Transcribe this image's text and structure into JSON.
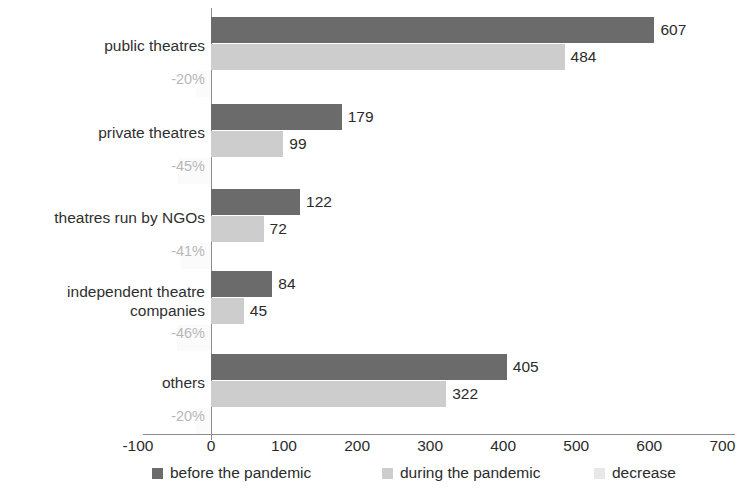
{
  "chart_data": {
    "type": "bar",
    "orientation": "horizontal",
    "title": "",
    "xlabel": "",
    "ylabel": "",
    "xlim": [
      -100,
      700
    ],
    "xticks": [
      -100,
      0,
      100,
      200,
      300,
      400,
      500,
      600,
      700
    ],
    "xtick_labels": [
      "-100",
      "0",
      "100",
      "200",
      "300",
      "400",
      "500",
      "600",
      "700"
    ],
    "grid": false,
    "legend_position": "bottom",
    "categories": [
      "public theatres",
      "private theatres",
      "theatres run by NGOs",
      "independent theatre\ncompanies",
      "others"
    ],
    "series": [
      {
        "name": "before the pandemic",
        "color": "#6b6b6b",
        "values": [
          607,
          179,
          122,
          84,
          405
        ],
        "labels": [
          "607",
          "179",
          "122",
          "84",
          "405"
        ]
      },
      {
        "name": "during the pandemic",
        "color": "#cdcdcd",
        "values": [
          484,
          99,
          72,
          45,
          322
        ],
        "labels": [
          "484",
          "99",
          "72",
          "45",
          "322"
        ]
      },
      {
        "name": "decrease",
        "color": "#fbfbfb",
        "values": [
          -20,
          -45,
          -41,
          -46,
          -20
        ],
        "labels": [
          "-20%",
          "-45%",
          "-41%",
          "-46%",
          "-20%"
        ]
      }
    ],
    "percent_labels": [
      "-20%",
      "-45%",
      "-41%",
      "-46%",
      "-20%"
    ]
  },
  "legend": {
    "items": [
      {
        "label": "before the pandemic",
        "color": "#6b6b6b"
      },
      {
        "label": "during the pandemic",
        "color": "#cdcdcd"
      },
      {
        "label": "decrease",
        "color": "#e8e8e8"
      }
    ]
  },
  "axis": {
    "tick_labels": [
      "-100",
      "0",
      "100",
      "200",
      "300",
      "400",
      "500",
      "600",
      "700"
    ]
  }
}
